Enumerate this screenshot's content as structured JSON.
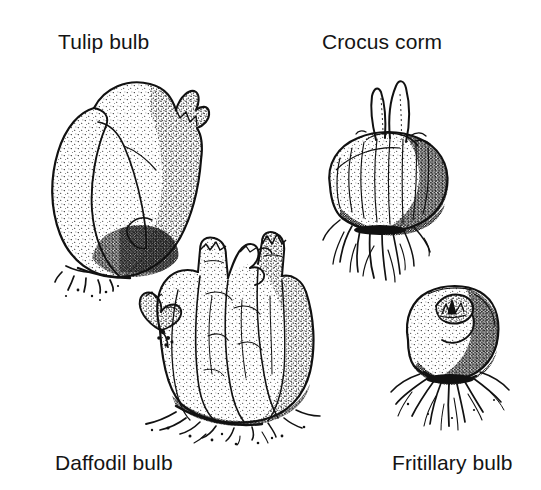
{
  "figure": {
    "kind": "botanical-line-illustration",
    "background_color": "#ffffff",
    "ink_color": "#111111",
    "width": 541,
    "height": 490,
    "style": "pen-and-ink stipple engraving"
  },
  "labels": {
    "tulip": "Tulip bulb",
    "crocus": "Crocus corm",
    "daffodil": "Daffodil bulb",
    "fritillary": "Fritillary bulb"
  },
  "specimens": [
    {
      "id": "tulip-bulb",
      "label": "Tulip bulb",
      "position": "top-left",
      "description": "Teardrop-shaped bulb with papery tunic peeling away on the left, dark stippled shading at lower right, short root stubs at base"
    },
    {
      "id": "crocus-corm",
      "label": "Crocus corm",
      "position": "top-right",
      "description": "Rounded flattened corm with two pointed shoots on top and wiry branching roots below"
    },
    {
      "id": "daffodil-bulb",
      "label": "Daffodil bulb",
      "position": "bottom-centre-left",
      "description": "Multi-nosed clustered bulb with several necks and a side offset, fibrous roots at base"
    },
    {
      "id": "fritillary-bulb",
      "label": "Fritillary bulb",
      "position": "bottom-right",
      "description": "Squat rounded bulb with a central hollow containing a pointed bud, spreading fibrous roots"
    }
  ]
}
